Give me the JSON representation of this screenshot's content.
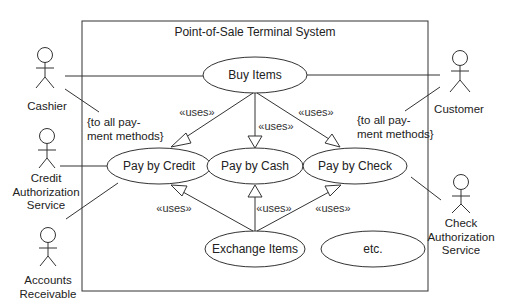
{
  "system": {
    "title": "Point-of-Sale Terminal System"
  },
  "use_cases": {
    "buy_items": "Buy Items",
    "pay_by_credit": "Pay by Credit",
    "pay_by_cash": "Pay by Cash",
    "pay_by_check": "Pay by Check",
    "exchange_items": "Exchange Items",
    "etc": "etc."
  },
  "actors": {
    "cashier": "Cashier",
    "credit_auth": [
      "Credit",
      "Authorization",
      "Service"
    ],
    "accounts_receivable": [
      "Accounts",
      "Receivable"
    ],
    "customer": "Customer",
    "check_auth": [
      "Check",
      "Authorization",
      "Service"
    ]
  },
  "stereotypes": {
    "uses": "«uses»"
  },
  "notes": {
    "cashier_note": [
      "{to all pay-",
      "ment methods}"
    ],
    "customer_note": [
      "{to all pay-",
      "ment methods}"
    ]
  },
  "colors": {
    "line": "#333333",
    "text": "#222222",
    "background": "#ffffff"
  }
}
